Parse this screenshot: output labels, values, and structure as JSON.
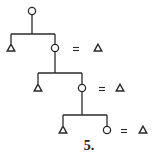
{
  "diagram": {
    "type": "tree-reduction",
    "stroke_color": "#2a2a2a",
    "symbols": {
      "circle": "circle-node",
      "triangle": "triangle-node",
      "equals": "="
    },
    "levels": [
      {
        "parent": {
          "shape": "circle",
          "x": 32,
          "y": 11
        },
        "bar_y": 34,
        "left_child": {
          "shape": "triangle",
          "x": 11,
          "y": 48
        },
        "right_child": {
          "shape": "circle",
          "x": 55,
          "y": 48
        },
        "equals": {
          "label": "=",
          "x": 76,
          "y": 49
        },
        "result": {
          "shape": "triangle",
          "x": 98,
          "y": 48
        }
      },
      {
        "parent": {
          "shape": "circle",
          "x": 55,
          "y": 48
        },
        "bar_y": 73,
        "left_child": {
          "shape": "triangle",
          "x": 38,
          "y": 88
        },
        "right_child": {
          "shape": "circle",
          "x": 82,
          "y": 88
        },
        "equals": {
          "label": "=",
          "x": 102,
          "y": 89
        },
        "result": {
          "shape": "triangle",
          "x": 120,
          "y": 88
        }
      },
      {
        "parent": {
          "shape": "circle",
          "x": 82,
          "y": 88
        },
        "bar_y": 115,
        "left_child": {
          "shape": "triangle",
          "x": 63,
          "y": 130
        },
        "right_child": {
          "shape": "circle",
          "x": 107,
          "y": 130
        },
        "equals": {
          "label": "=",
          "x": 124,
          "y": 131
        },
        "result": {
          "shape": "triangle",
          "x": 143,
          "y": 130
        }
      }
    ],
    "caption": "5."
  }
}
